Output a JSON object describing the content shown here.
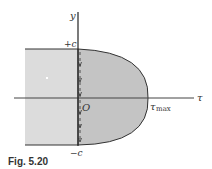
{
  "figure": {
    "caption": "Fig. 5.20",
    "labels": {
      "y_axis": "y",
      "x_axis": "τ",
      "top": "+c",
      "bottom": "−c",
      "origin": "O",
      "tau_max_main": "τ",
      "tau_max_sub": "max"
    },
    "colors": {
      "beam_fill": "#dcdcdc",
      "parabola_fill": "#c4c4c4",
      "line": "#333333"
    }
  }
}
